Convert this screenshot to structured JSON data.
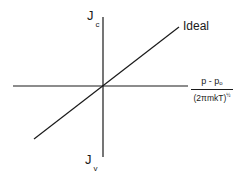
{
  "diagram": {
    "type": "line-plot-schematic",
    "y_axis": {
      "top_label": {
        "main": "J",
        "subscript": "c"
      },
      "bottom_label": {
        "main": "J",
        "subscript": "v"
      }
    },
    "x_axis": {
      "label": {
        "numerator_main": "p - p",
        "numerator_subscript": "o",
        "denominator_main": "(2πmkT)",
        "denominator_superscript": "½"
      }
    },
    "lines": [
      {
        "name": "Ideal",
        "label": "Ideal",
        "description": "straight line through origin with positive slope"
      }
    ],
    "colors": {
      "line": "#1a1a1a",
      "background": "#ffffff"
    }
  }
}
